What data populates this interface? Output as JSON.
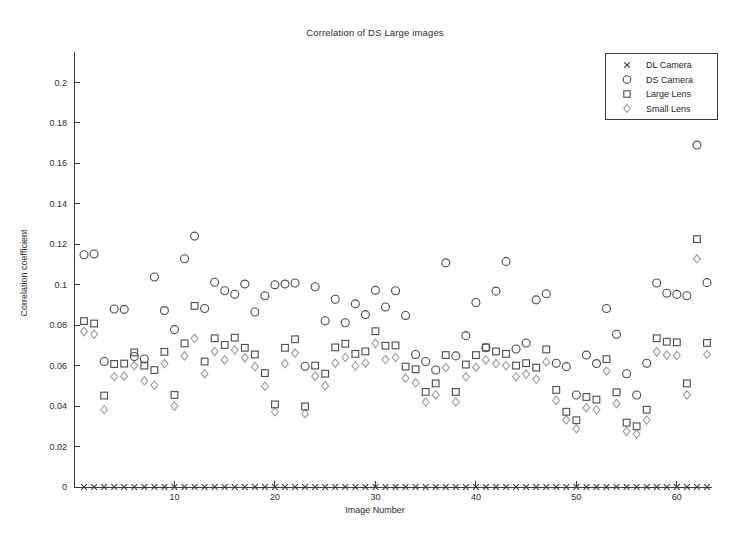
{
  "chart_data": {
    "type": "scatter",
    "title": "Correlation of DS Large images",
    "xlabel": "Image Number",
    "ylabel": "Correlation coefficient",
    "xlim": [
      0,
      63.5
    ],
    "ylim": [
      0,
      0.215
    ],
    "xticks": [
      10,
      20,
      30,
      40,
      50,
      60
    ],
    "yticks": [
      0,
      0.02,
      0.04,
      0.06,
      0.08,
      0.1,
      0.12,
      0.14,
      0.16,
      0.18,
      0.2
    ],
    "ytick_labels": [
      "0",
      "0.02",
      "0.04",
      "0.06",
      "0.08",
      "0.1",
      "0.12",
      "0.14",
      "0.16",
      "0.18",
      "0.2"
    ],
    "grid": false,
    "legend_position": "upper right",
    "x": [
      1,
      2,
      3,
      4,
      5,
      6,
      7,
      8,
      9,
      10,
      11,
      12,
      13,
      14,
      15,
      16,
      17,
      18,
      19,
      20,
      21,
      22,
      23,
      24,
      25,
      26,
      27,
      28,
      29,
      30,
      31,
      32,
      33,
      34,
      35,
      36,
      37,
      38,
      39,
      40,
      41,
      42,
      43,
      44,
      45,
      46,
      47,
      48,
      49,
      50,
      51,
      52,
      53,
      54,
      55,
      56,
      57,
      58,
      59,
      60,
      61,
      62,
      63
    ],
    "series": [
      {
        "name": "DL Camera",
        "marker": "x",
        "color": "#3a3a3a",
        "values": [
          0,
          0,
          0,
          0,
          0,
          0,
          0,
          0,
          0,
          0,
          0,
          0,
          0,
          0,
          0,
          0,
          0,
          0,
          0,
          0,
          0,
          0,
          0,
          0,
          0,
          0,
          0,
          0,
          0,
          0,
          0,
          0,
          0,
          0,
          0,
          0,
          0,
          0,
          0,
          0,
          0,
          0,
          0,
          0,
          0,
          0,
          0,
          0,
          0,
          0,
          0,
          0,
          0,
          0,
          0,
          0,
          0,
          0,
          0,
          0,
          0,
          0,
          0
        ]
      },
      {
        "name": "DS Camera",
        "marker": "o",
        "color": "#4a4a4a",
        "values": [
          0.1148,
          0.1152,
          0.062,
          0.088,
          0.0878,
          0.0645,
          0.0633,
          0.1038,
          0.0872,
          0.0778,
          0.1128,
          0.124,
          0.0882,
          0.1012,
          0.097,
          0.0953,
          0.1003,
          0.0865,
          0.0945,
          0.1,
          0.1003,
          0.1008,
          0.0597,
          0.099,
          0.0822,
          0.0928,
          0.0812,
          0.0905,
          0.0852,
          0.0972,
          0.089,
          0.097,
          0.0848,
          0.0655,
          0.062,
          0.0578,
          0.1108,
          0.0648,
          0.0748,
          0.0912,
          0.0688,
          0.0968,
          0.1115,
          0.0682,
          0.0712,
          0.0925,
          0.0955,
          0.0612,
          0.0595,
          0.0455,
          0.0652,
          0.061,
          0.0882,
          0.0755,
          0.056,
          0.0455,
          0.0612,
          0.1008,
          0.0958,
          0.0952,
          0.0945,
          0.169,
          0.101
        ]
      },
      {
        "name": "Large Lens",
        "marker": "s",
        "color": "#4a4a4a",
        "values": [
          0.082,
          0.0808,
          0.0452,
          0.0608,
          0.061,
          0.0665,
          0.06,
          0.0578,
          0.0668,
          0.0455,
          0.071,
          0.0895,
          0.062,
          0.0735,
          0.0702,
          0.0738,
          0.0688,
          0.0655,
          0.0563,
          0.0408,
          0.0688,
          0.073,
          0.0398,
          0.06,
          0.056,
          0.069,
          0.0708,
          0.0658,
          0.067,
          0.077,
          0.0698,
          0.07,
          0.0595,
          0.0582,
          0.047,
          0.0512,
          0.0652,
          0.047,
          0.0605,
          0.0652,
          0.069,
          0.067,
          0.0658,
          0.06,
          0.0612,
          0.059,
          0.068,
          0.048,
          0.0372,
          0.033,
          0.0445,
          0.0432,
          0.0632,
          0.0468,
          0.0318,
          0.03,
          0.0382,
          0.0735,
          0.0718,
          0.0715,
          0.0512,
          0.1225,
          0.0712
        ]
      },
      {
        "name": "Small Lens",
        "marker": "d",
        "color": "#9a9a9a",
        "values": [
          0.0768,
          0.0755,
          0.0382,
          0.0545,
          0.0548,
          0.06,
          0.0525,
          0.0503,
          0.061,
          0.04,
          0.0648,
          0.0735,
          0.056,
          0.067,
          0.0628,
          0.0678,
          0.0638,
          0.0595,
          0.0498,
          0.0372,
          0.061,
          0.0662,
          0.0362,
          0.0548,
          0.05,
          0.0612,
          0.064,
          0.0598,
          0.0612,
          0.071,
          0.063,
          0.064,
          0.0538,
          0.0515,
          0.042,
          0.0455,
          0.059,
          0.042,
          0.0545,
          0.0592,
          0.0628,
          0.061,
          0.06,
          0.0545,
          0.0558,
          0.0532,
          0.0618,
          0.0428,
          0.0332,
          0.0288,
          0.0392,
          0.0382,
          0.0572,
          0.0412,
          0.0275,
          0.0262,
          0.033,
          0.0668,
          0.0652,
          0.065,
          0.0455,
          0.1128,
          0.0655
        ]
      }
    ]
  },
  "legend": {
    "items": [
      {
        "label": "DL Camera",
        "marker": "x"
      },
      {
        "label": "DS Camera",
        "marker": "o"
      },
      {
        "label": "Large Lens",
        "marker": "s"
      },
      {
        "label": "Small Lens",
        "marker": "d"
      }
    ]
  }
}
